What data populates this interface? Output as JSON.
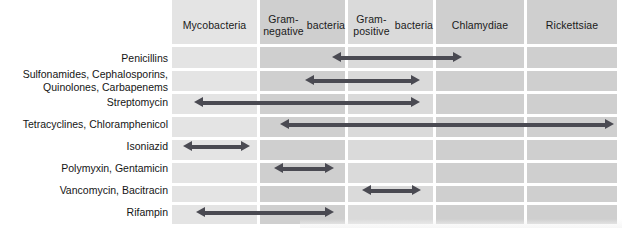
{
  "figure": {
    "colors": {
      "arrow": "#4a4a52",
      "column_light": "#e4e4e4",
      "column_mid": "#cfcfcf",
      "column_midlight": "#dadada",
      "separator": "#ffffff",
      "text": "#151515"
    }
  },
  "columns": [
    {
      "id": "mycobacteria",
      "label": "Mycobacteria",
      "x": 172,
      "width": 85,
      "shade": "shade-light"
    },
    {
      "id": "gram-negative",
      "label": "Gram-negative\nbacteria",
      "x": 260,
      "width": 85,
      "shade": "shade-mid"
    },
    {
      "id": "gram-positive",
      "label": "Gram-positive\nbacteria",
      "x": 348,
      "width": 85,
      "shade": "shade-midlight"
    },
    {
      "id": "chlamydiae",
      "label": "Chlamydiae",
      "x": 436,
      "width": 88,
      "shade": "shade-mid"
    },
    {
      "id": "rickettsiae",
      "label": "Rickettsiae",
      "x": 527,
      "width": 90,
      "shade": "shade-mid"
    }
  ],
  "rows": [
    {
      "id": "penicillins",
      "label": "Penicillins",
      "label_top": 52,
      "band_top": 46,
      "band_height": 22,
      "arrow": {
        "x1": 332,
        "x2": 462,
        "y": 52
      }
    },
    {
      "id": "sulfonamides",
      "label": "Sulfonamides, Cephalosporins,\nQuinolones, Carbapenems",
      "label_top": 68,
      "band_top": 71,
      "band_height": 21,
      "arrow": {
        "x1": 305,
        "x2": 420,
        "y": 75
      }
    },
    {
      "id": "streptomycin",
      "label": "Streptomycin",
      "label_top": 96,
      "band_top": 95,
      "band_height": 21,
      "arrow": {
        "x1": 194,
        "x2": 420,
        "y": 97
      }
    },
    {
      "id": "tetracyclines",
      "label": "Tetracyclines, Chloramphenicol",
      "label_top": 118,
      "band_top": 119,
      "band_height": 21,
      "arrow": {
        "x1": 280,
        "x2": 614,
        "y": 119
      }
    },
    {
      "id": "isoniazid",
      "label": "Isoniazid",
      "label_top": 140,
      "band_top": 143,
      "band_height": 21,
      "arrow": {
        "x1": 183,
        "x2": 250,
        "y": 141
      }
    },
    {
      "id": "polymyxin",
      "label": "Polymyxin, Gentamicin",
      "label_top": 162,
      "band_top": 166,
      "band_height": 21,
      "arrow": {
        "x1": 274,
        "x2": 334,
        "y": 163
      }
    },
    {
      "id": "vancomycin",
      "label": "Vancomycin, Bacitracin",
      "label_top": 184,
      "band_top": 189,
      "band_height": 21,
      "arrow": {
        "x1": 362,
        "x2": 421,
        "y": 185
      }
    },
    {
      "id": "rifampin",
      "label": "Rifampin",
      "label_top": 206,
      "band_top": 212,
      "band_height": 12,
      "arrow": {
        "x1": 196,
        "x2": 334,
        "y": 207
      }
    }
  ],
  "separators": {
    "horizontal_y": [
      44,
      68,
      91,
      114,
      137,
      160,
      183,
      202
    ],
    "vertical_x": [
      257,
      345,
      433,
      524
    ]
  },
  "chart_data": {
    "type": "table",
    "categories": [
      "Mycobacteria",
      "Gram-negative bacteria",
      "Gram-positive bacteria",
      "Chlamydiae",
      "Rickettsiae"
    ],
    "rows": [
      {
        "drug": "Penicillins",
        "covers": [
          "Gram-positive bacteria"
        ]
      },
      {
        "drug": "Sulfonamides, Cephalosporins, Quinolones, Carbapenems",
        "covers": [
          "Gram-negative bacteria",
          "Gram-positive bacteria"
        ]
      },
      {
        "drug": "Streptomycin",
        "covers": [
          "Mycobacteria",
          "Gram-negative bacteria",
          "Gram-positive bacteria"
        ]
      },
      {
        "drug": "Tetracyclines, Chloramphenicol",
        "covers": [
          "Gram-negative bacteria",
          "Gram-positive bacteria",
          "Chlamydiae",
          "Rickettsiae"
        ]
      },
      {
        "drug": "Isoniazid",
        "covers": [
          "Mycobacteria"
        ]
      },
      {
        "drug": "Polymyxin, Gentamicin",
        "covers": [
          "Gram-negative bacteria"
        ]
      },
      {
        "drug": "Vancomycin, Bacitracin",
        "covers": [
          "Gram-positive bacteria"
        ]
      },
      {
        "drug": "Rifampin",
        "covers": [
          "Mycobacteria",
          "Gram-negative bacteria"
        ]
      }
    ],
    "xlabel": "",
    "ylabel": "",
    "legend": []
  }
}
